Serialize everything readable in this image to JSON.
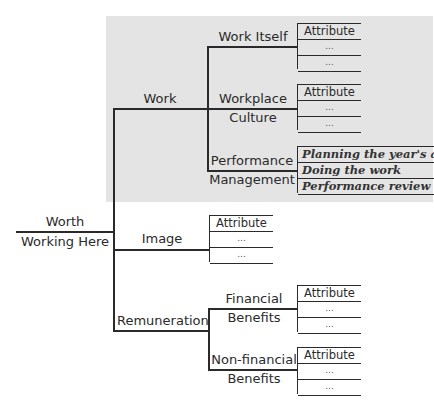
{
  "root": {
    "label_line1": "Worth",
    "label_line2": "Working Here"
  },
  "branches": {
    "work": {
      "label": "Work",
      "children": {
        "work_itself": {
          "label": "Work Itself",
          "attributes": [
            "Attribute",
            "...",
            "..."
          ]
        },
        "workplace_culture": {
          "label_line1": "Workplace",
          "label_line2": "Culture",
          "attributes": [
            "Attribute",
            "...",
            "..."
          ]
        },
        "performance_management": {
          "label_line1": "Performance",
          "label_line2": "Management",
          "attributes": [
            "Planning the year's acti",
            "Doing the work",
            "Performance review"
          ]
        }
      }
    },
    "image": {
      "label": "Image",
      "attributes": [
        "Attribute",
        "...",
        "..."
      ]
    },
    "remuneration": {
      "label": "Remuneration",
      "children": {
        "financial": {
          "label_line1": "Financial",
          "label_line2": "Benefits",
          "attributes": [
            "Attribute",
            "...",
            "..."
          ]
        },
        "non_financial": {
          "label_line1": "Non-financial",
          "label_line2": "Benefits",
          "attributes": [
            "Attribute",
            "...",
            "..."
          ]
        }
      }
    }
  },
  "colors": {
    "highlight_background": "#e4e4e4",
    "line": "#2a2a2a"
  }
}
